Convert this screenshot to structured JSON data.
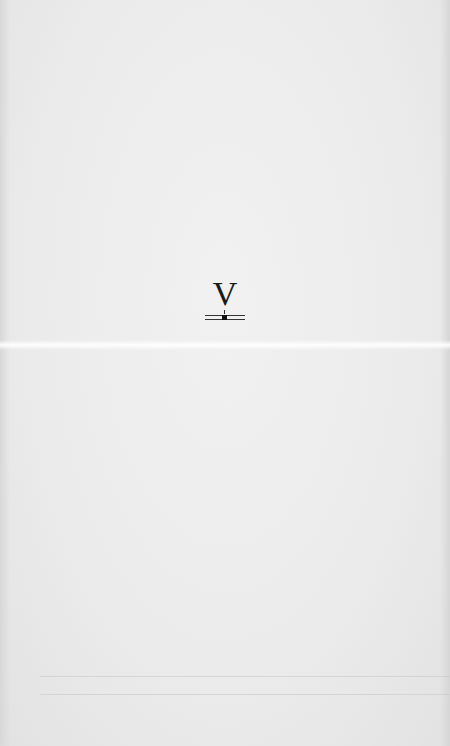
{
  "page": {
    "type": "scanned-book-page",
    "background_color": "#ececec",
    "text_color": "#1a1a1a"
  },
  "section": {
    "numeral": "V",
    "ornament": "double-rule-with-center-dot"
  }
}
